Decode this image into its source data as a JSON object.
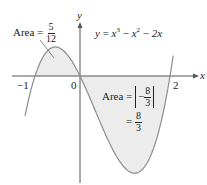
{
  "figure": {
    "function_label": "y = x³ − x² − 2x",
    "function_parts": {
      "lhs": "y",
      "eq": "=",
      "t1": "x",
      "e1": "3",
      "op1": "−",
      "t2": "x",
      "e2": "2",
      "op2": "−",
      "t3": "2x"
    },
    "x_axis_label": "x",
    "y_axis_label": "y",
    "x_ticks": [
      "−1",
      "0",
      "2"
    ],
    "area_left": {
      "prefix": "Area =",
      "numerator": "5",
      "denominator": "12"
    },
    "area_right": {
      "prefix": "Area =",
      "sign": "−",
      "numerator": "8",
      "denominator": "3",
      "eq": "=",
      "numerator2": "8",
      "denominator2": "3"
    },
    "colors": {
      "curve": "#8c8c8c",
      "fill": "#ececec",
      "axis": "#555555",
      "text": "#222222"
    }
  },
  "chart_data": {
    "type": "area",
    "title": "",
    "function": "x^3 - x^2 - 2x",
    "roots": [
      -1,
      0,
      2
    ],
    "xlim": [
      -1.22,
      2.07
    ],
    "shaded_regions": [
      {
        "from": -1,
        "to": 0,
        "area": "5/12",
        "sign": "positive"
      },
      {
        "from": 0,
        "to": 2,
        "area": "8/3",
        "signed_integral": "-8/3"
      }
    ],
    "local_max": {
      "x": -0.549,
      "y": 0.631
    },
    "local_min": {
      "x": 1.215,
      "y": -2.113
    },
    "xlabel": "x",
    "ylabel": "y",
    "x_tick_labels": [
      "−1",
      "0",
      "2"
    ],
    "grid": false
  }
}
